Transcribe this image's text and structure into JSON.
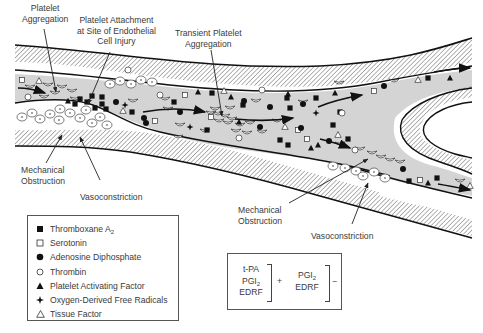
{
  "figure": {
    "type": "vascular thrombosis schematic",
    "elements": {
      "vessel": "branching blood vessel with hatched walls, gray lumen, flow arrows",
      "platelets": "white crescent discs",
      "red_cells": "white circles with central dot, along wall"
    }
  },
  "labels": {
    "platelet_aggregation": [
      "Platelet",
      "Aggregation"
    ],
    "platelet_attachment": [
      "Platelet Attachment",
      "at Site of Endothelial",
      "Cell Injury"
    ],
    "transient_aggregation": [
      "Transient Platelet",
      "Aggregation"
    ],
    "mechanical_obstruction_left": [
      "Mechanical",
      "Obstruction"
    ],
    "vasoconstriction_left": "Vasoconstriction",
    "mechanical_obstruction_right": [
      "Mechanical",
      "Obstruction"
    ],
    "vasoconstriction_right": "Vasoconstriction"
  },
  "legend": {
    "items": [
      {
        "symbol": "filled-square",
        "label": "Thromboxane A",
        "sub": "2"
      },
      {
        "symbol": "open-square",
        "label": "Serotonin",
        "sub": ""
      },
      {
        "symbol": "filled-circle",
        "label": "Adenosine Diphosphate",
        "sub": ""
      },
      {
        "symbol": "open-circle",
        "label": "Thrombin",
        "sub": ""
      },
      {
        "symbol": "filled-triangle",
        "label": "Platelet Activating Factor",
        "sub": ""
      },
      {
        "symbol": "four-point-star",
        "label": "Oxygen-Derived Free Radicals",
        "sub": ""
      },
      {
        "symbol": "open-triangle",
        "label": "Tissue Factor",
        "sub": ""
      }
    ]
  },
  "formula": {
    "group1": {
      "lines": [
        "t-PA",
        "PGI",
        "EDRF"
      ],
      "sub_on_line2": "2",
      "sign": "+"
    },
    "group2": {
      "lines": [
        "PGI",
        "EDRF"
      ],
      "sub_on_line1": "2",
      "sign": "−"
    }
  },
  "colors": {
    "lumen": "#d4d4d4",
    "wall_line": "#111111",
    "hatch": "#555555",
    "text": "#3a3a3a"
  }
}
